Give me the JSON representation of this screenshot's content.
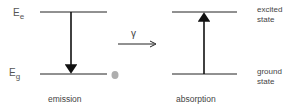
{
  "left_panel": {
    "excited_label_main": "E",
    "excited_label_sub": "e",
    "ground_label_main": "E",
    "ground_label_sub": "g",
    "caption": "emission",
    "arrow_direction": "down"
  },
  "middle": {
    "photon_symbol": "γ",
    "arrow_direction": "right"
  },
  "right_panel": {
    "excited_state_line1": "excited",
    "excited_state_line2": "state",
    "ground_state_line1": "ground",
    "ground_state_line2": "state",
    "caption": "absorption",
    "arrow_direction": "up"
  },
  "colors": {
    "line": "#222222",
    "text": "#444444",
    "dot": "#9a9a9a"
  }
}
